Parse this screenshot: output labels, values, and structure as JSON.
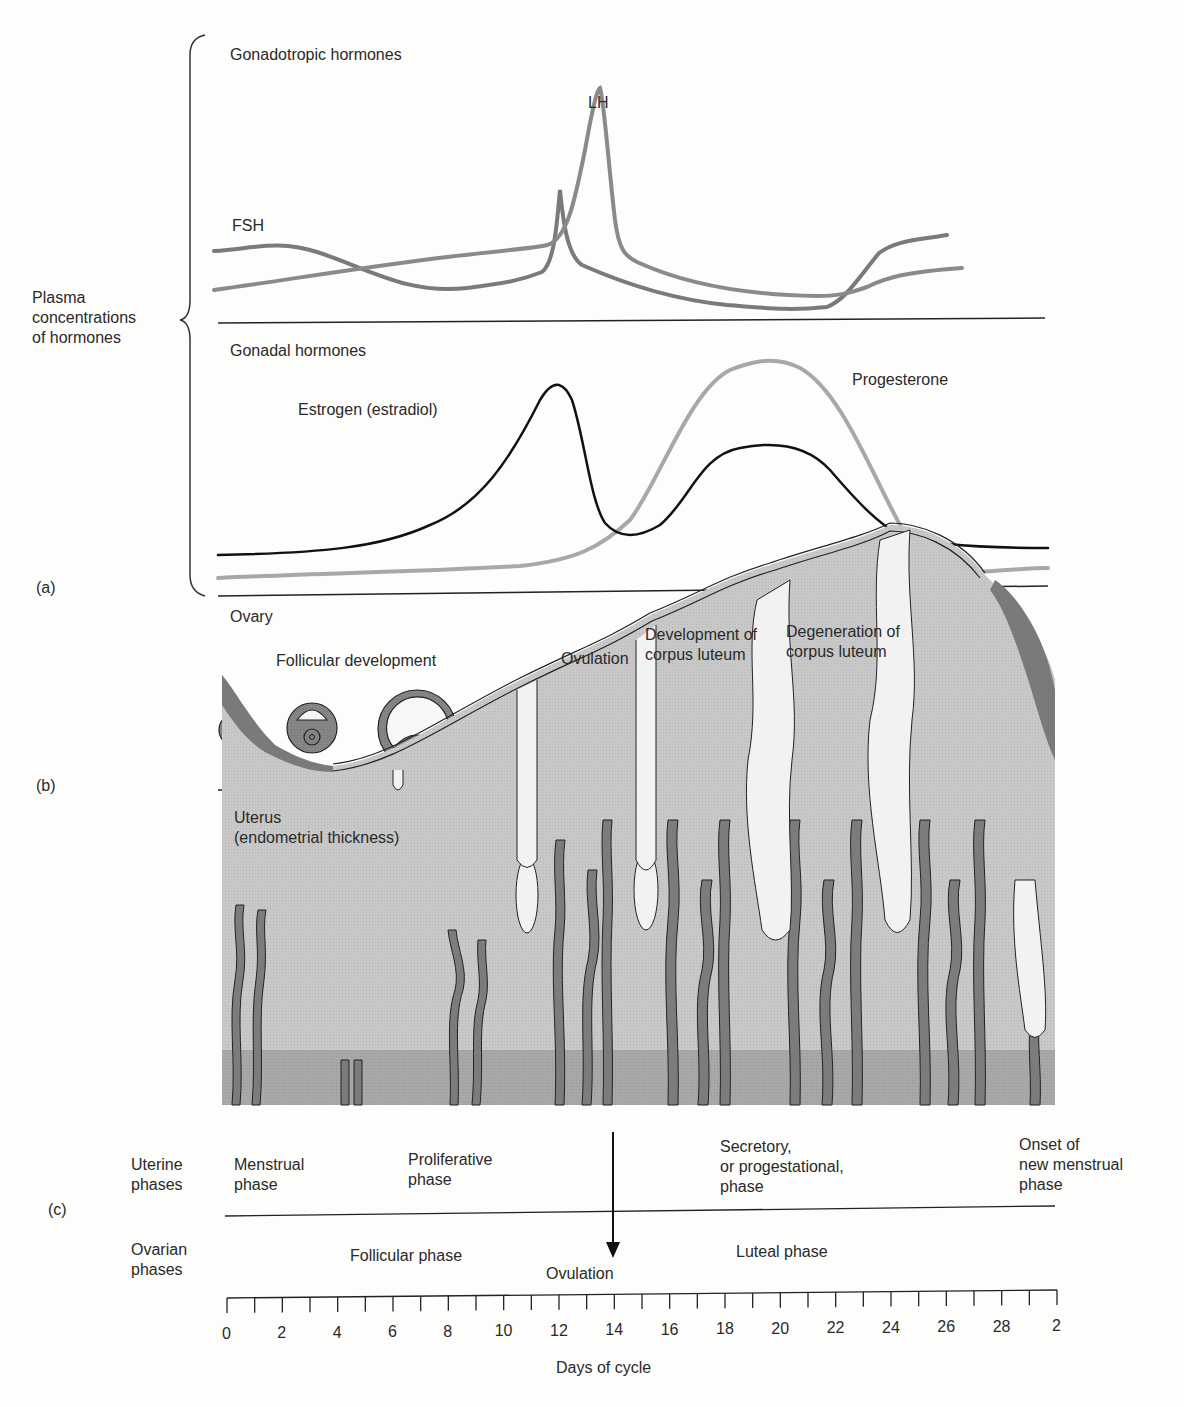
{
  "panel_a": {
    "letter": "(a)",
    "y_label": [
      "Plasma",
      "concentrations",
      "of hormones"
    ],
    "top_title": "Gonadotropic hormones",
    "bottom_title": "Gonadal hormones",
    "labels": {
      "fsh": "FSH",
      "lh": "LH",
      "estrogen": "Estrogen (estradiol)",
      "progesterone": "Progesterone"
    }
  },
  "panel_b": {
    "letter": "(b)",
    "title": "Ovary",
    "stages": [
      {
        "label": "Follicular development"
      },
      {
        "label": "Ovulation"
      },
      {
        "label": "Development of corpus luteum",
        "line1": "Development of",
        "line2": "corpus luteum"
      },
      {
        "label": "Degeneration of corpus luteum",
        "line1": "Degeneration of",
        "line2": "corpus luteum"
      }
    ]
  },
  "panel_c": {
    "letter": "(c)",
    "title_line1": "Uterus",
    "title_line2": "(endometrial thickness)",
    "uterine_phases_label": [
      "Uterine",
      "phases"
    ],
    "uterine_phases": [
      {
        "lines": [
          "Menstrual",
          "phase"
        ]
      },
      {
        "lines": [
          "Proliferative",
          "phase"
        ]
      },
      {
        "lines": [
          "Secretory,",
          "or progestational,",
          "phase"
        ]
      },
      {
        "lines": [
          "Onset of",
          "new menstrual",
          "phase"
        ]
      }
    ],
    "ovarian_phases_label": [
      "Ovarian",
      "phases"
    ],
    "ovarian_phases": [
      "Follicular phase",
      "Luteal phase"
    ],
    "ovulation_label": "Ovulation"
  },
  "axis": {
    "label": "Days of cycle",
    "tick_labels": [
      "0",
      "2",
      "4",
      "6",
      "8",
      "10",
      "12",
      "14",
      "16",
      "18",
      "20",
      "22",
      "24",
      "26",
      "28",
      "2"
    ]
  },
  "colors": {
    "lh": "#8a8a8a",
    "fsh": "#7a7a7a",
    "estrogen": "#111111",
    "progesterone": "#a8a8a8",
    "tissue_light": "#c9c9c9",
    "tissue_base": "#a9a9a9",
    "vessel": "#7c7c7c"
  },
  "chart_data": [
    {
      "type": "line",
      "title": "Gonadotropic hormones",
      "xlabel": "Days of cycle",
      "ylabel": "Plasma concentrations of hormones",
      "x": [
        0,
        2,
        4,
        6,
        8,
        10,
        12,
        13,
        13.5,
        14,
        15,
        18,
        20,
        22,
        24,
        25,
        26,
        28
      ],
      "series": [
        {
          "name": "LH",
          "values": [
            15,
            18,
            20,
            22,
            25,
            27,
            30,
            50,
            100,
            50,
            28,
            18,
            14,
            12,
            12,
            13,
            20,
            24
          ]
        },
        {
          "name": "FSH",
          "values": [
            32,
            33,
            28,
            20,
            17,
            16,
            18,
            40,
            66,
            35,
            20,
            12,
            9,
            7,
            6,
            12,
            35,
            40
          ]
        }
      ],
      "ylim": [
        0,
        100
      ],
      "grid": false
    },
    {
      "type": "line",
      "title": "Gonadal hormones",
      "xlabel": "Days of cycle",
      "ylabel": "Plasma concentrations of hormones",
      "x": [
        0,
        2,
        4,
        6,
        8,
        10,
        11,
        12,
        13,
        14,
        15,
        16,
        18,
        20,
        22,
        24,
        26,
        28
      ],
      "series": [
        {
          "name": "Estrogen (estradiol)",
          "values": [
            12,
            13,
            16,
            22,
            35,
            60,
            85,
            95,
            55,
            25,
            23,
            32,
            52,
            56,
            46,
            18,
            13,
            12
          ]
        },
        {
          "name": "Progesterone",
          "values": [
            3,
            3,
            4,
            4,
            5,
            6,
            8,
            10,
            22,
            45,
            75,
            92,
            100,
            98,
            78,
            30,
            5,
            6
          ]
        }
      ],
      "ylim": [
        0,
        100
      ],
      "grid": false
    }
  ]
}
